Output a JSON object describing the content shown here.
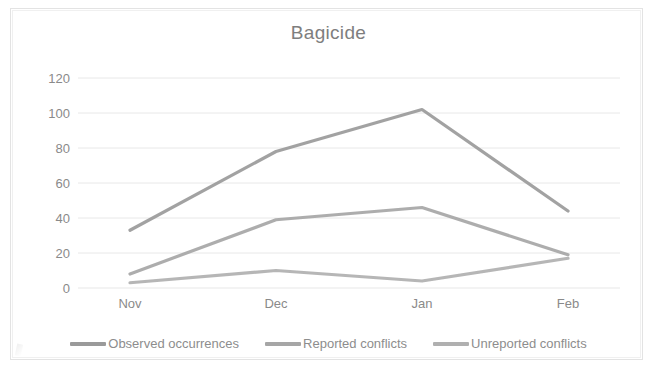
{
  "chart_data": {
    "type": "line",
    "title": "Bagicide",
    "xlabel": "",
    "ylabel": "",
    "categories": [
      "Nov",
      "Dec",
      "Jan",
      "Feb"
    ],
    "ylim": [
      0,
      120
    ],
    "yticks": [
      0,
      20,
      40,
      60,
      80,
      100,
      120
    ],
    "ytick_labels": [
      "0",
      "20",
      "40",
      "60",
      "80",
      "100",
      "120"
    ],
    "grid": "horizontal",
    "legend_position": "bottom",
    "series": [
      {
        "name": "Observed occurrences",
        "values": [
          33,
          78,
          102,
          44
        ],
        "color": "#9a9a9a"
      },
      {
        "name": "Reported conflicts",
        "values": [
          8,
          39,
          46,
          19
        ],
        "color": "#a6a6a6"
      },
      {
        "name": "Unreported conflicts",
        "values": [
          3,
          10,
          4,
          17
        ],
        "color": "#b0b0b0"
      }
    ]
  },
  "legend": {
    "items": [
      {
        "label": "Observed occurrences"
      },
      {
        "label": "Reported conflicts"
      },
      {
        "label": "Unreported conflicts"
      }
    ]
  },
  "style": {
    "grid_color": "#e8e8e8",
    "axis_text_color": "#8a8a8a",
    "title_color": "#7e7e7e",
    "background": "#ffffff"
  }
}
